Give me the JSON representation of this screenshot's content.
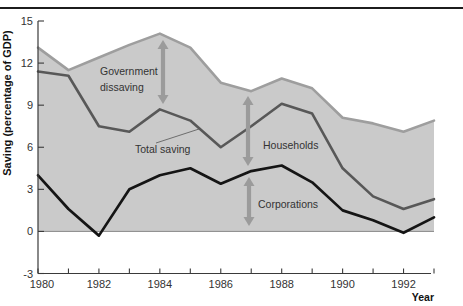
{
  "figure": {
    "ylabel": "Saving (percentage of GDP)",
    "xlabel": "Year"
  },
  "chart_data": {
    "type": "area",
    "title": "",
    "xlabel": "Year",
    "ylabel": "Saving (percentage of GDP)",
    "x": [
      1980,
      1981,
      1982,
      1983,
      1984,
      1985,
      1986,
      1987,
      1988,
      1989,
      1990,
      1991,
      1992,
      1993
    ],
    "xlim": [
      1980,
      1993
    ],
    "ylim": [
      -3,
      15
    ],
    "yticks": [
      15,
      12,
      9,
      6,
      3,
      0,
      -3
    ],
    "xticks_labeled": [
      1980,
      1982,
      1984,
      1986,
      1988,
      1990,
      1992
    ],
    "grid": false,
    "legend_position": "none",
    "series": [
      {
        "name": "private-saving-top-boundary",
        "values": [
          13.1,
          11.5,
          12.4,
          13.3,
          14.1,
          13.1,
          10.6,
          10.0,
          10.9,
          10.2,
          8.1,
          7.7,
          7.1,
          7.9
        ],
        "color": "#9e9e9e",
        "width": 2.6,
        "fill_to_zero": true,
        "fill_color": "#cacaca"
      },
      {
        "name": "total-saving",
        "values": [
          11.4,
          11.1,
          7.5,
          7.1,
          8.7,
          7.9,
          6.0,
          7.5,
          9.1,
          8.4,
          4.5,
          2.5,
          1.6,
          2.3
        ],
        "color": "#585858",
        "width": 2.6
      },
      {
        "name": "corporations",
        "values": [
          4.0,
          1.6,
          -0.3,
          3.0,
          4.0,
          4.5,
          3.4,
          4.3,
          4.7,
          3.5,
          1.5,
          0.8,
          -0.1,
          1.0
        ],
        "color": "#151515",
        "width": 2.7
      }
    ],
    "annotations": [
      {
        "id": "government-dissaving-label",
        "lines": [
          "Government",
          "dissaving"
        ],
        "x": 100,
        "y": 75,
        "line_gap": 16
      },
      {
        "id": "total-saving-label",
        "lines": [
          "Total saving"
        ],
        "x": 135,
        "y": 153,
        "line_gap": 16,
        "leader": {
          "x1": 156,
          "y1": 143,
          "x2": 199,
          "y2": 129
        }
      },
      {
        "id": "households-label",
        "lines": [
          "Households"
        ],
        "x": 263,
        "y": 149,
        "line_gap": 16
      },
      {
        "id": "corporations-label",
        "lines": [
          "Corporations"
        ],
        "x": 258,
        "y": 208,
        "line_gap": 16
      }
    ],
    "arrows": [
      {
        "id": "government-dissaving-arrow",
        "x": 163,
        "y1": 40,
        "y2": 104
      },
      {
        "id": "households-arrow",
        "x": 248,
        "y1": 96,
        "y2": 166
      },
      {
        "id": "corporations-arrow",
        "x": 249,
        "y1": 177,
        "y2": 226
      }
    ],
    "colors": {
      "arrow": "#9b9b9b",
      "axis": "#3a3a3a",
      "tick_label": "#333333",
      "annotation_text": "#333333",
      "zero_line": "#8a8a8a",
      "leader_line": "#555555",
      "axis_title": "#111111"
    }
  }
}
